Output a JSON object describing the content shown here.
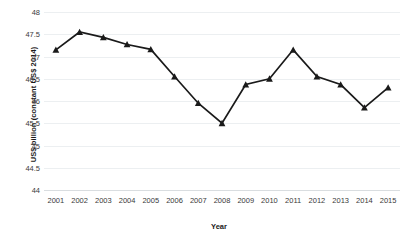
{
  "chart_data": {
    "type": "line",
    "title": "",
    "xlabel": "Year",
    "ylabel": "US$ billion (constant US$ 2014)",
    "categories": [
      "2001",
      "2002",
      "2003",
      "2004",
      "2005",
      "2006",
      "2007",
      "2008",
      "2009",
      "2010",
      "2011",
      "2012",
      "2013",
      "2014",
      "2015"
    ],
    "values": [
      47.15,
      47.55,
      47.43,
      47.27,
      47.16,
      46.55,
      45.95,
      45.5,
      46.37,
      46.5,
      47.15,
      46.55,
      46.37,
      45.85,
      46.3
    ],
    "series": [
      {
        "name": "US$ billion (constant US$ 2014)",
        "values": [
          47.15,
          47.55,
          47.43,
          47.27,
          47.16,
          46.55,
          45.95,
          45.5,
          46.37,
          46.5,
          47.15,
          46.55,
          46.37,
          45.85,
          46.3
        ]
      }
    ],
    "ylim": [
      44,
      48
    ],
    "yticks": [
      44,
      44.5,
      45,
      45.5,
      46,
      46.5,
      47,
      47.5,
      48
    ],
    "ytick_labels": [
      "44",
      "44.5",
      "45",
      "45.5",
      "46",
      "46.5",
      "47",
      "47.5",
      "48"
    ],
    "xtick_labels": [
      "2001",
      "2002",
      "2003",
      "2004",
      "2005",
      "2006",
      "2007",
      "2008",
      "2009",
      "2010",
      "2011",
      "2012",
      "2013",
      "2014",
      "2015"
    ],
    "grid": true,
    "legend": false,
    "legend_position": "none",
    "marker": "triangle",
    "line_color": "#1a1a1a",
    "marker_color": "#1a1a1a",
    "grid_color": "#eceff1",
    "background_color": "#ffffff"
  }
}
